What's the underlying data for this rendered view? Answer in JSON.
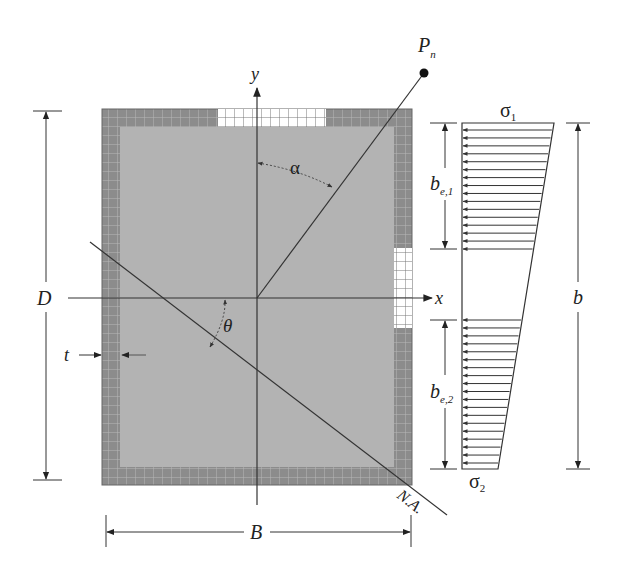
{
  "figure": {
    "type": "cross-section-diagram"
  },
  "labels": {
    "load": "P",
    "load_sub": "n",
    "y_axis": "y",
    "x_axis": "x",
    "alpha": "α",
    "theta": "θ",
    "depth": "D",
    "thickness": "t",
    "width": "B",
    "neutral_axis": "N.A.",
    "sigma1": "σ",
    "sigma1_sub": "1",
    "sigma2": "σ",
    "sigma2_sub": "2",
    "be1": "b",
    "be1_sub": "e,1",
    "be2": "b",
    "be2_sub": "e,2",
    "plate_width": "b"
  },
  "colors": {
    "core_fill": "#b3b3b3",
    "wall_fill": "#8c8c8c",
    "grid_line": "#c8c8c8",
    "ineffective_fill": "#ffffff",
    "line": "#333333"
  },
  "geometry": {
    "section_outer": {
      "x": 102,
      "y": 109,
      "w": 310,
      "h": 376
    },
    "wall_thickness": 18,
    "origin": {
      "x": 257,
      "y": 298
    },
    "top_ineffective_x": [
      218,
      326
    ],
    "right_ineffective_y": [
      248,
      328
    ],
    "stress_block": {
      "top_y": 123,
      "bottom_y": 469,
      "left_x": 462,
      "top_right_x": 554,
      "bottom_right_x": 498
    },
    "be1_range_y": [
      123,
      249
    ],
    "be2_range_y": [
      320,
      469
    ],
    "arrow_count_upper": 16,
    "arrow_count_lower": 19
  }
}
